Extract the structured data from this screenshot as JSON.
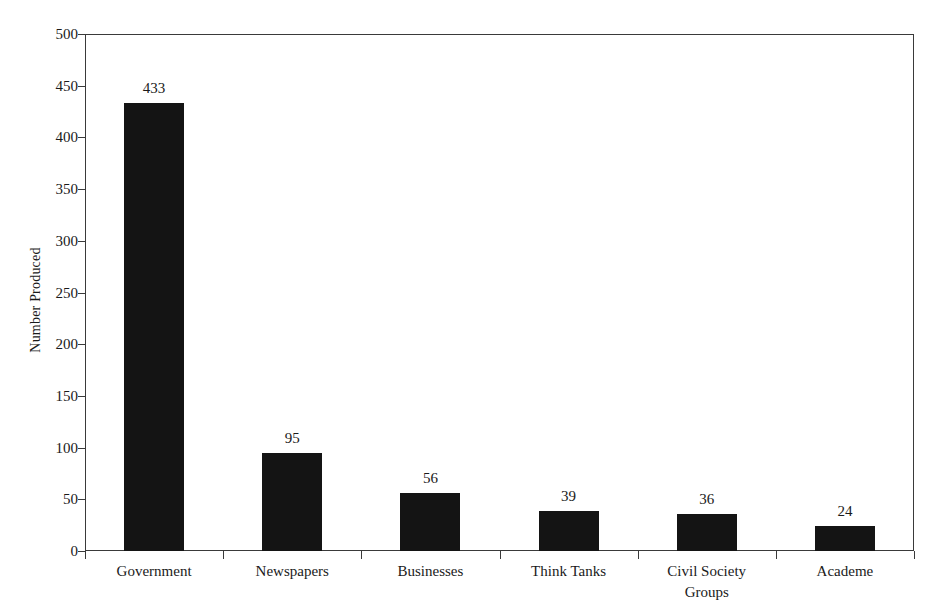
{
  "chart_data": {
    "type": "bar",
    "title": "",
    "subtitle": "",
    "xlabel": "",
    "ylabel": "Number Produced",
    "categories": [
      "Government",
      "Newspapers",
      "Businesses",
      "Think Tanks",
      "Civil Society\nGroups",
      "Academe"
    ],
    "values": [
      433,
      95,
      56,
      39,
      36,
      24
    ],
    "value_labels": [
      "433",
      "95",
      "56",
      "39",
      "36",
      "24"
    ],
    "ylim": [
      0,
      500
    ],
    "ytick_labels": [
      "500",
      "450",
      "400",
      "350",
      "300",
      "250",
      "200",
      "150",
      "100",
      "50",
      "0"
    ],
    "ytick_values": [
      500,
      450,
      400,
      350,
      300,
      250,
      200,
      150,
      100,
      50,
      0
    ],
    "ytick_step": 50,
    "grid": false,
    "legend": false,
    "legend_position": "none",
    "bar_color": "#141414",
    "axis_color": "#3a3a3a",
    "background_color": "#ffffff",
    "text_color": "#1a1a1a"
  }
}
